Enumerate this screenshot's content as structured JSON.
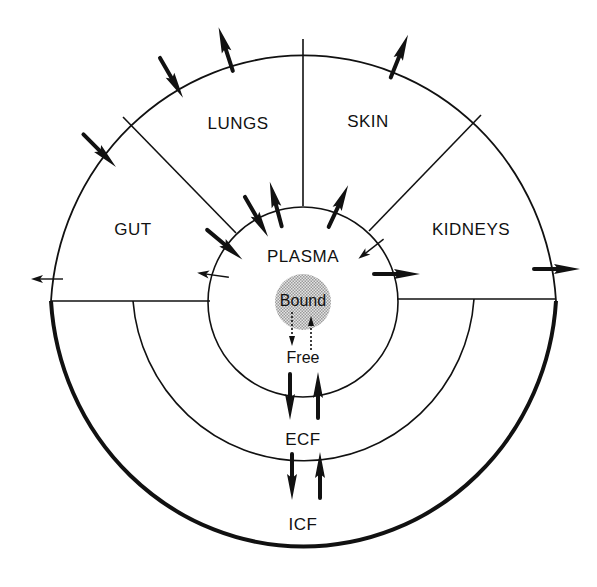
{
  "diagram": {
    "type": "compartment-distribution-diagram",
    "regions": {
      "lungs": "LUNGS",
      "skin": "SKIN",
      "gut": "GUT",
      "kidneys": "KIDNEYS",
      "plasma": "PLASMA",
      "bound": "Bound",
      "free": "Free",
      "ecf": "ECF",
      "icf": "ICF"
    },
    "flows": [
      {
        "from": "outside",
        "to": "gut",
        "style": "bold",
        "label": "gut-intake"
      },
      {
        "from": "outside",
        "to": "lungs",
        "style": "bold",
        "label": "lungs-intake"
      },
      {
        "from": "lungs",
        "to": "outside",
        "style": "bold",
        "label": "lungs-exhalation"
      },
      {
        "from": "skin",
        "to": "outside",
        "style": "bold",
        "label": "skin-excretion"
      },
      {
        "from": "kidneys",
        "to": "outside",
        "style": "bold",
        "label": "kidney-excretion"
      },
      {
        "from": "gut",
        "to": "outside",
        "style": "thin",
        "label": "gut-excretion"
      },
      {
        "from": "gut",
        "to": "plasma",
        "style": "bold",
        "label": "gut-absorption"
      },
      {
        "from": "lungs",
        "to": "plasma",
        "style": "bold",
        "label": "lungs-absorption"
      },
      {
        "from": "plasma",
        "to": "lungs",
        "style": "bold",
        "label": "plasma-to-lungs"
      },
      {
        "from": "plasma",
        "to": "skin",
        "style": "bold",
        "label": "plasma-to-skin"
      },
      {
        "from": "kidneys",
        "to": "plasma",
        "style": "thin",
        "label": "kidney-reabsorption"
      },
      {
        "from": "plasma",
        "to": "kidneys",
        "style": "bold",
        "label": "plasma-to-kidneys"
      },
      {
        "from": "plasma",
        "to": "gut",
        "style": "thin",
        "label": "plasma-to-gut"
      },
      {
        "from": "bound",
        "to": "free",
        "style": "dotted",
        "label": "dissociation"
      },
      {
        "from": "free",
        "to": "bound",
        "style": "dotted",
        "label": "binding"
      },
      {
        "from": "plasma",
        "to": "ecf",
        "style": "bold",
        "label": "plasma-to-ecf"
      },
      {
        "from": "ecf",
        "to": "plasma",
        "style": "bold",
        "label": "ecf-to-plasma"
      },
      {
        "from": "ecf",
        "to": "icf",
        "style": "bold",
        "label": "ecf-to-icf"
      },
      {
        "from": "icf",
        "to": "ecf",
        "style": "bold",
        "label": "icf-to-ecf"
      }
    ],
    "colors": {
      "line": "#111111",
      "bound_fill": "#c8c8c8",
      "background": "#ffffff"
    }
  }
}
